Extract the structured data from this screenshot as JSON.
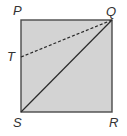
{
  "diagram": {
    "type": "geometry-square",
    "colors": {
      "fill": "#d3d3d3",
      "stroke": "#4a4a4a",
      "label": "#333333",
      "background": "#ffffff"
    },
    "vertices": {
      "P": {
        "label": "P",
        "x": 21,
        "y": 20
      },
      "Q": {
        "label": "Q",
        "x": 112,
        "y": 20
      },
      "R": {
        "label": "R",
        "x": 112,
        "y": 112
      },
      "S": {
        "label": "S",
        "x": 21,
        "y": 112
      },
      "T": {
        "label": "T",
        "x": 21,
        "y": 57
      }
    },
    "segments": [
      {
        "from": "S",
        "to": "Q",
        "style": "solid"
      },
      {
        "from": "T",
        "to": "Q",
        "style": "dashed"
      }
    ]
  }
}
